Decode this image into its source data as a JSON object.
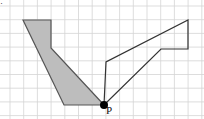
{
  "diagram": {
    "type": "grid-transformation",
    "grid": {
      "x0": 10,
      "y0": 6,
      "cell": 13.7,
      "cols": 14,
      "rows": 8,
      "line_color": "#d4d4d4"
    },
    "point_label": "P",
    "point": [
      104,
      105
    ],
    "shaded_shape": {
      "fill": "#bdbdbd",
      "stroke": "#555555",
      "points": [
        [
          23,
          20
        ],
        [
          51,
          20
        ],
        [
          51,
          48
        ],
        [
          104,
          105
        ],
        [
          64,
          105
        ]
      ]
    },
    "outline_shape": {
      "stroke": "#333333",
      "points": [
        [
          104,
          105
        ],
        [
          106,
          62
        ],
        [
          188,
          20
        ],
        [
          188,
          49
        ],
        [
          161,
          49
        ]
      ]
    },
    "corner_mark": "·"
  }
}
